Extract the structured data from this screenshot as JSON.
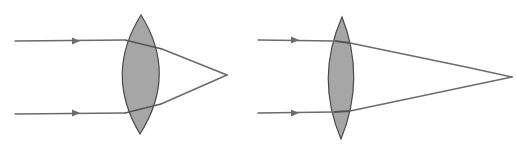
{
  "diagram": {
    "colors": {
      "background": "#ffffff",
      "lens_fill": "#a6a6a6",
      "lens_stroke": "#4a4a4a",
      "ray": "#6b6b6b"
    },
    "panels": [
      {
        "id": "thick-lens",
        "description": "Thick biconvex lens — parallel rays converge to a near focal point (short focal length)",
        "lens": {
          "top": [
            141,
            15
          ],
          "bottom": [
            140,
            134
          ],
          "left_bulge_x": 116,
          "right_bulge_x": 166
        },
        "rays": [
          {
            "start": [
              15,
              41
            ],
            "arrow_at": [
              76,
              41
            ],
            "enter": [
              125,
              40
            ],
            "exit": [
              162,
              49
            ],
            "focus": [
              227,
              75
            ]
          },
          {
            "start": [
              15,
              114
            ],
            "arrow_at": [
              76,
              113
            ],
            "enter": [
              125,
              113
            ],
            "exit": [
              161,
              104
            ],
            "focus": [
              227,
              75
            ]
          }
        ],
        "focal_point": [
          227,
          75
        ]
      },
      {
        "id": "thin-lens",
        "description": "Thin biconvex lens — parallel rays converge to a far focal point (long focal length)",
        "lens": {
          "top": [
            342,
            17
          ],
          "bottom": [
            341,
            139
          ],
          "left_bulge_x": 328,
          "right_bulge_x": 353
        },
        "rays": [
          {
            "start": [
              258,
              40
            ],
            "arrow_at": [
              295,
              40
            ],
            "enter": [
              335,
              41
            ],
            "exit": [
              350,
              43
            ],
            "focus": [
              512,
              77
            ]
          },
          {
            "start": [
              258,
              113
            ],
            "arrow_at": [
              295,
              113
            ],
            "enter": [
              334,
              112
            ],
            "exit": [
              350,
              111
            ],
            "focus": [
              512,
              77
            ]
          }
        ],
        "focal_point": [
          512,
          77
        ]
      }
    ]
  }
}
